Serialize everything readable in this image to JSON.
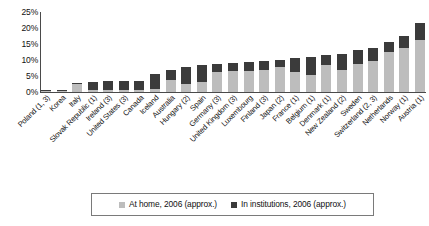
{
  "chart_data": {
    "type": "bar",
    "subtype": "stacked-column",
    "title": "",
    "xlabel": "",
    "ylabel": "",
    "ylim": [
      0,
      25
    ],
    "ytick_labels": [
      "25%",
      "20%",
      "15%",
      "10%",
      "5%",
      "0%"
    ],
    "ytick_values": [
      25,
      20,
      15,
      10,
      5,
      0
    ],
    "grid": false,
    "legend_position": "bottom",
    "categories": [
      "Poland (1, 3)",
      "Korea",
      "Italy",
      "Slovak Republic (1)",
      "Ireland (3)",
      "United States (3)",
      "Canada",
      "Iceland",
      "Australia",
      "Hungary (2)",
      "Spain",
      "Germany (3)",
      "United Kingdom (3)",
      "Luxembourg",
      "Finland (3)",
      "Japan (2)",
      "France (1)",
      "Belgium (1)",
      "Denmark (1)",
      "New Zealand (2)",
      "Sweden",
      "Switzerland (2, 3)",
      "Netherlands",
      "Norway (1)",
      "Austria (1)"
    ],
    "series": [
      {
        "name": "At home, 2006 (approx.)",
        "color": "#bdbdbd",
        "values": [
          0.2,
          0.3,
          2.4,
          0.6,
          0.5,
          0.6,
          0.6,
          1.0,
          3.6,
          2.6,
          3.2,
          6.3,
          6.5,
          6.5,
          7.0,
          7.8,
          6.3,
          5.2,
          8.3,
          7.0,
          8.7,
          9.8,
          12.6,
          13.8,
          16.4
        ]
      },
      {
        "name": "In institutions, 2006 (approx.)",
        "color": "#3b3b3b",
        "values": [
          0.4,
          0.4,
          0.5,
          2.4,
          2.8,
          2.8,
          3.0,
          4.6,
          3.2,
          5.3,
          5.4,
          2.6,
          2.6,
          2.8,
          2.6,
          2.2,
          4.4,
          5.8,
          3.2,
          5.0,
          4.3,
          4.0,
          3.0,
          3.6,
          5.2
        ]
      }
    ]
  },
  "legend": {
    "items": [
      {
        "label": "At home, 2006 (approx.)",
        "color": "#bdbdbd"
      },
      {
        "label": "In institutions, 2006 (approx.)",
        "color": "#3b3b3b"
      }
    ]
  }
}
